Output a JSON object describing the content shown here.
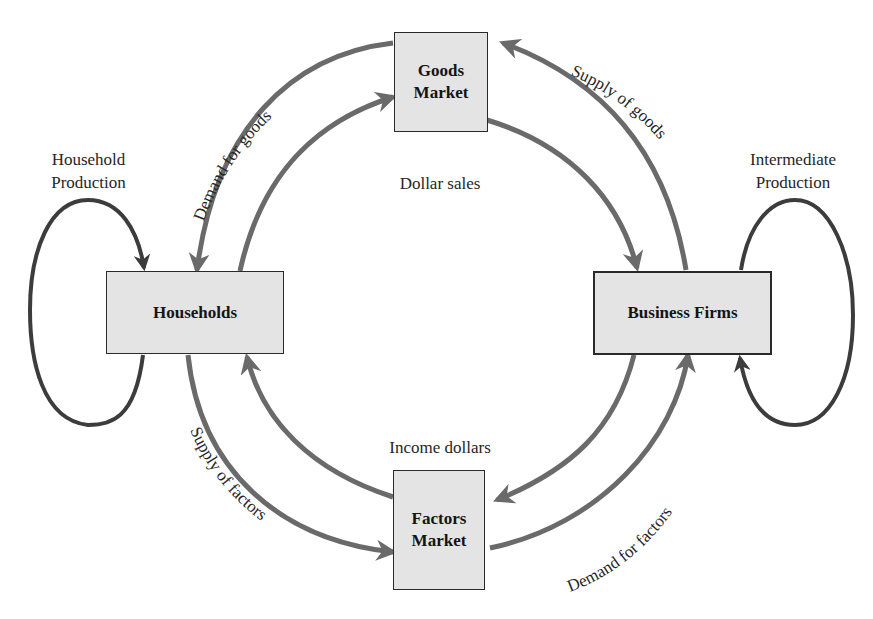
{
  "colors": {
    "background": "#ffffff",
    "box_fill": "#e4e4e4",
    "box_border": "#2a2a2a",
    "outer_flow_arrow": "#6a6a6a",
    "inner_flow_arrow": "#6a6a6a",
    "loop_arrow": "#3c3c3c",
    "text": "#262626"
  },
  "nodes": {
    "goods_market": {
      "line1": "Goods",
      "line2": "Market"
    },
    "factors_market": {
      "line1": "Factors",
      "line2": "Market"
    },
    "households": {
      "label": "Households"
    },
    "business_firms": {
      "label": "Business Firms"
    }
  },
  "labels": {
    "household_production_1": "Household",
    "household_production_2": "Production",
    "intermediate_production_1": "Intermediate",
    "intermediate_production_2": "Production",
    "dollar_sales": "Dollar sales",
    "income_dollars": "Income dollars",
    "demand_for_goods": "Demand for goods",
    "supply_of_goods": "Supply of goods",
    "supply_of_factors": "Supply of factors",
    "demand_for_factors": "Demand for factors"
  },
  "flows": [
    {
      "from": "Goods Market",
      "to": "Households",
      "label": "Demand for goods",
      "ring": "outer"
    },
    {
      "from": "Business Firms",
      "to": "Goods Market",
      "label": "Supply of goods",
      "ring": "outer"
    },
    {
      "from": "Households",
      "to": "Factors Market",
      "label": "Supply of factors",
      "ring": "outer"
    },
    {
      "from": "Factors Market",
      "to": "Business Firms",
      "label": "Demand for factors",
      "ring": "outer"
    },
    {
      "from": "Households",
      "to": "Goods Market",
      "label": "",
      "ring": "inner"
    },
    {
      "from": "Goods Market",
      "to": "Business Firms",
      "label": "Dollar sales",
      "ring": "inner"
    },
    {
      "from": "Business Firms",
      "to": "Factors Market",
      "label": "",
      "ring": "inner"
    },
    {
      "from": "Factors Market",
      "to": "Households",
      "label": "Income dollars",
      "ring": "inner"
    },
    {
      "from": "Households",
      "to": "Households",
      "label": "Household Production",
      "ring": "loop"
    },
    {
      "from": "Business Firms",
      "to": "Business Firms",
      "label": "Intermediate Production",
      "ring": "loop"
    }
  ]
}
